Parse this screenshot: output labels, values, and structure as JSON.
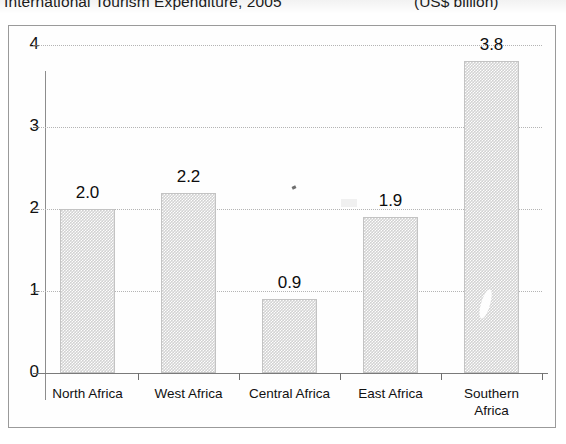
{
  "header": {
    "title": "International Tourism Expenditure, 2005",
    "units": "(US$ billion)"
  },
  "chart_data": {
    "type": "bar",
    "title": "International Tourism Expenditure, 2005",
    "subtitle": "(US$ billion)",
    "xlabel": "",
    "ylabel": "",
    "unit": "US$ billion",
    "categories": [
      "North Africa",
      "West Africa",
      "Central Africa",
      "East Africa",
      "Southern Africa"
    ],
    "values": [
      2.0,
      2.2,
      0.9,
      1.9,
      3.8
    ],
    "data_labels": [
      "2.0",
      "2.2",
      "0.9",
      "1.9",
      "3.8"
    ],
    "ylim": [
      0,
      4
    ],
    "yticks": [
      0,
      1,
      2,
      3,
      4
    ],
    "ytick_labels": [
      "0",
      "1",
      "2",
      "3",
      "4"
    ],
    "grid": true,
    "gridlines": "horizontal-dotted",
    "legend": false,
    "legend_position": "none",
    "bar_fill": "#d2d2d2",
    "bar_pattern": "fine-checker-dither",
    "bar_border": "#c3c3c3",
    "frame_color": "#9a9a9a",
    "axis_color": "#8d8d8d",
    "text_color": "#111111"
  },
  "categories_display": [
    {
      "label": "North Africa",
      "value": "2.0"
    },
    {
      "label": "West Africa",
      "value": "2.2"
    },
    {
      "label": "Central Africa",
      "value": "0.9"
    },
    {
      "label": "East Africa",
      "value": "1.9"
    },
    {
      "label": "Southern\nAfrica",
      "value": "3.8"
    }
  ],
  "axis": {
    "y_labels": [
      "4",
      "3",
      "2",
      "1",
      "0"
    ]
  }
}
